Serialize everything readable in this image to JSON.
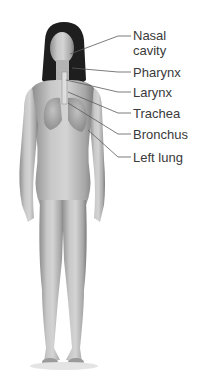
{
  "diagram": {
    "colors": {
      "label_text": "#3a3a3a",
      "leader_line": "#5a5a5a",
      "skin": "#bdbdbd",
      "background": "#ffffff"
    },
    "labels": [
      {
        "id": "nasal-cavity",
        "lines": [
          "Nasal",
          "cavity"
        ],
        "top": 28,
        "line_y": 36,
        "target": [
          70,
          54
        ]
      },
      {
        "id": "pharynx",
        "lines": [
          "Pharynx"
        ],
        "top": 65,
        "line_y": 72,
        "target": [
          72,
          68
        ]
      },
      {
        "id": "larynx",
        "lines": [
          "Larynx"
        ],
        "top": 85,
        "line_y": 92,
        "target": [
          66,
          80
        ]
      },
      {
        "id": "trachea",
        "lines": [
          "Trachea"
        ],
        "top": 106,
        "line_y": 113,
        "target": [
          68,
          92
        ]
      },
      {
        "id": "bronchus",
        "lines": [
          "Bronchus"
        ],
        "top": 127,
        "line_y": 134,
        "target": [
          68,
          103
        ]
      },
      {
        "id": "left-lung",
        "lines": [
          "Left lung"
        ],
        "top": 150,
        "line_y": 157,
        "target": [
          88,
          130
        ]
      }
    ]
  },
  "text": {
    "nasal_1": "Nasal",
    "nasal_2": "cavity",
    "pharynx": "Pharynx",
    "larynx": "Larynx",
    "trachea": "Trachea",
    "bronchus": "Bronchus",
    "left_lung": "Left lung"
  }
}
